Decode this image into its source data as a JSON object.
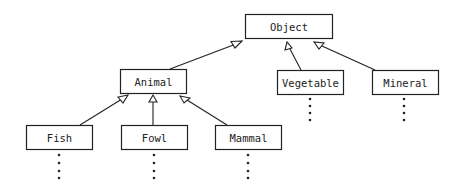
{
  "diagram": {
    "type": "class-hierarchy",
    "nodes": [
      {
        "id": "object",
        "label": "Object",
        "x": 245,
        "y": 14,
        "w": 87,
        "h": 24,
        "continues": false
      },
      {
        "id": "animal",
        "label": "Animal",
        "x": 120,
        "y": 69,
        "w": 66,
        "h": 24,
        "continues": false
      },
      {
        "id": "vegetable",
        "label": "Vegetable",
        "x": 277,
        "y": 70,
        "w": 66,
        "h": 24,
        "continues": true
      },
      {
        "id": "mineral",
        "label": "Mineral",
        "x": 372,
        "y": 70,
        "w": 66,
        "h": 24,
        "continues": true
      },
      {
        "id": "fish",
        "label": "Fish",
        "x": 26,
        "y": 125,
        "w": 66,
        "h": 24,
        "continues": true
      },
      {
        "id": "fowl",
        "label": "Fowl",
        "x": 121,
        "y": 125,
        "w": 66,
        "h": 24,
        "continues": true
      },
      {
        "id": "mammal",
        "label": "Mammal",
        "x": 215,
        "y": 125,
        "w": 66,
        "h": 24,
        "continues": true
      }
    ],
    "edges": [
      {
        "from": "animal",
        "to": "object",
        "relation": "inherits"
      },
      {
        "from": "vegetable",
        "to": "object",
        "relation": "inherits"
      },
      {
        "from": "mineral",
        "to": "object",
        "relation": "inherits"
      },
      {
        "from": "fish",
        "to": "animal",
        "relation": "inherits"
      },
      {
        "from": "fowl",
        "to": "animal",
        "relation": "inherits"
      },
      {
        "from": "mammal",
        "to": "animal",
        "relation": "inherits"
      }
    ],
    "colors": {
      "stroke": "#222222",
      "fill": "#ffffff"
    }
  }
}
